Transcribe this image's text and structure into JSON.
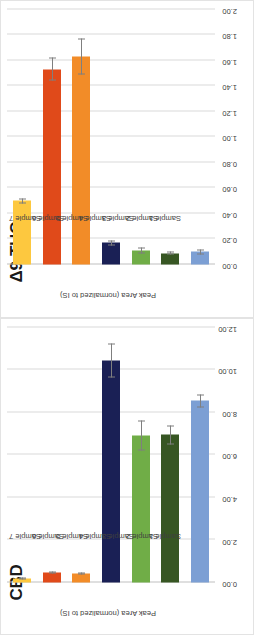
{
  "figure": {
    "orientation": "rotated-90",
    "panels": [
      "thc",
      "cbd"
    ]
  },
  "chart_data": [
    {
      "id": "thc",
      "type": "bar",
      "orientation": "horizontal",
      "title": "Δ9-THC",
      "xlabel": "",
      "ylabel": "Peak Area (normalized to IS)",
      "categories": [
        "Sample 1",
        "Sample 2",
        "Sample 3",
        "Sample 4",
        "Sample 5",
        "Sample 6",
        "Sample 7"
      ],
      "values": [
        0.1,
        0.09,
        0.11,
        0.17,
        1.63,
        1.53,
        0.5
      ],
      "errors": [
        0.02,
        0.01,
        0.02,
        0.02,
        0.14,
        0.09,
        0.02
      ],
      "colors": [
        "#7C9FD4",
        "#375623",
        "#70AD47",
        "#1A2055",
        "#F28C28",
        "#E04A1A",
        "#FDC83F"
      ],
      "ticks": [
        "0.00",
        "0.20",
        "0.40",
        "0.60",
        "0.80",
        "1.00",
        "1.20",
        "1.40",
        "1.60",
        "1.80",
        "2.00"
      ],
      "tickvalues": [
        0,
        0.2,
        0.4,
        0.6,
        0.8,
        1.0,
        1.2,
        1.4,
        1.6,
        1.8,
        2.0
      ],
      "xlim": [
        0,
        2.0
      ],
      "grid": true,
      "legend": "none"
    },
    {
      "id": "cbd",
      "type": "bar",
      "orientation": "horizontal",
      "title": "CBD",
      "xlabel": "",
      "ylabel": "Peak Area (normalized to IS)",
      "categories": [
        "Sample 1",
        "Sample 2",
        "Sample 3",
        "Sample 4",
        "Sample 5",
        "Sample 6",
        "Sample 7"
      ],
      "values": [
        8.55,
        6.95,
        6.9,
        10.45,
        0.42,
        0.45,
        0.18
      ],
      "errors": [
        0.3,
        0.45,
        0.7,
        0.8,
        0.05,
        0.05,
        0.04
      ],
      "colors": [
        "#7C9FD4",
        "#375623",
        "#70AD47",
        "#1A2055",
        "#F28C28",
        "#E04A1A",
        "#FDC83F"
      ],
      "ticks": [
        "0.00",
        "2.00",
        "4.00",
        "6.00",
        "8.00",
        "10.00",
        "12.00"
      ],
      "tickvalues": [
        0,
        2,
        4,
        6,
        8,
        10,
        12
      ],
      "xlim": [
        0,
        12.0
      ],
      "grid": true,
      "legend": "none"
    }
  ]
}
